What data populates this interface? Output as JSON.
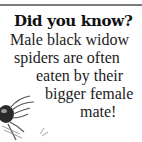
{
  "fact_card": {
    "heading": "Did you know?",
    "lines": [
      "Male black widow",
      "spiders are often",
      "eaten by their",
      "bigger female",
      "mate!"
    ]
  },
  "illustration": {
    "subject": "spider-illustration"
  }
}
